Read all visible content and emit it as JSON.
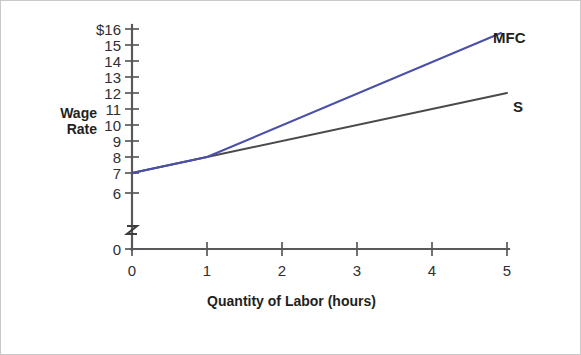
{
  "chart_data": {
    "type": "line",
    "title": "",
    "xlabel": "Quantity of Labor (hours)",
    "ylabel": "Wage Rate",
    "xlim": [
      0,
      5
    ],
    "ylim": [
      6,
      16
    ],
    "y_axis_broken": true,
    "y_break_symbol": "z",
    "grid": false,
    "legend_position": "right-of-line-ends",
    "x_ticks": [
      "0",
      "1",
      "2",
      "3",
      "4",
      "5"
    ],
    "y_ticks": [
      "$16",
      "15",
      "14",
      "13",
      "12",
      "11",
      "10",
      "9",
      "8",
      "7",
      "6",
      "0"
    ],
    "y_tick_values": [
      16,
      15,
      14,
      13,
      12,
      11,
      10,
      9,
      8,
      7,
      6,
      0
    ],
    "currency_symbol": "$",
    "series": [
      {
        "name": "S",
        "label": "S",
        "color": "#4a4a4c",
        "x": [
          0,
          1,
          5
        ],
        "values": [
          7,
          8,
          12
        ]
      },
      {
        "name": "MFC",
        "label": "MFC",
        "color": "#4a4fa8",
        "x": [
          0,
          1,
          5
        ],
        "values": [
          7,
          8,
          16
        ]
      }
    ]
  },
  "colors": {
    "mfc_line": "#4a4fa8",
    "supply_line": "#4a4a4c",
    "axis": "#58595b",
    "text": "#231f20",
    "frame_border": "#c9c9c9",
    "background": "#ffffff"
  }
}
